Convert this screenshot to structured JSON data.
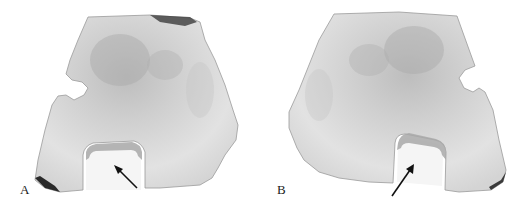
{
  "figure": {
    "panels": [
      {
        "label": "A",
        "description": "Photograph of sectioned specimen with rectangular cavity; arrow points into cavity",
        "arrow": {
          "from": [
            137,
            187
          ],
          "to": [
            116,
            167
          ]
        }
      },
      {
        "label": "B",
        "description": "Mirror-view photograph of sectioned specimen with rectangular cavity; arrow points into cavity",
        "arrow": {
          "from": [
            133,
            195
          ],
          "to": [
            155,
            164
          ]
        }
      }
    ],
    "colors": {
      "background": "#ffffff",
      "specimen_light": "#e4e4e4",
      "specimen_mid": "#c9c9c9",
      "specimen_dark": "#8a8a8a",
      "edge": "#3a3a3a",
      "cavity": "#f6f6f6",
      "arrow": "#111111",
      "label": "#1a1a1a"
    }
  }
}
